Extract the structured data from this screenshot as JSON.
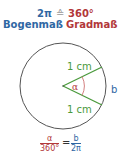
{
  "header": {
    "bogen_value": "2π",
    "equiv_symbol": "≙",
    "grad_value": "360°",
    "bogen_label": "Bogenmaß",
    "grad_label": "Gradmaß"
  },
  "diagram": {
    "radius_label_top": "1 cm",
    "radius_label_bottom": "1 cm",
    "angle_label": "α",
    "arc_label": "b",
    "colors": {
      "circle": "#555555",
      "radius": "#4a9a3c",
      "angle": "#b2383a",
      "arc_label": "#2f67a3"
    }
  },
  "formula": {
    "left_num": "α",
    "left_den": "360°",
    "equals": "=",
    "right_num": "b",
    "right_den": "2π"
  }
}
